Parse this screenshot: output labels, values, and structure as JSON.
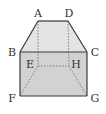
{
  "diagram": {
    "type": "geometric-solid",
    "colors": {
      "stroke": "#3a3a3a",
      "top_face_fill": "#e4e4e4",
      "front_face_fill": "#d2d2d2",
      "hidden_line": "#666666",
      "label": "#333333"
    },
    "vertices": {
      "A": {
        "x": 38,
        "y": 21,
        "label": "A",
        "lx": 38,
        "ly": 17
      },
      "D": {
        "x": 68,
        "y": 21,
        "label": "D",
        "lx": 69,
        "ly": 17
      },
      "B": {
        "x": 20,
        "y": 52,
        "label": "B",
        "lx": 12,
        "ly": 56
      },
      "C": {
        "x": 87,
        "y": 52,
        "label": "C",
        "lx": 95,
        "ly": 56
      },
      "E": {
        "x": 38,
        "y": 66,
        "label": "E",
        "lx": 30,
        "ly": 68
      },
      "H": {
        "x": 69,
        "y": 66,
        "label": "H",
        "lx": 76,
        "ly": 68
      },
      "F": {
        "x": 20,
        "y": 96,
        "label": "F",
        "lx": 12,
        "ly": 102
      },
      "G": {
        "x": 87,
        "y": 96,
        "label": "G",
        "lx": 95,
        "ly": 102
      }
    },
    "solid_edges": [
      "AD",
      "AB",
      "DC",
      "BC",
      "BF",
      "CG",
      "FG"
    ],
    "hidden_edges": [
      "AE",
      "DH",
      "EH",
      "EF",
      "HG"
    ]
  }
}
